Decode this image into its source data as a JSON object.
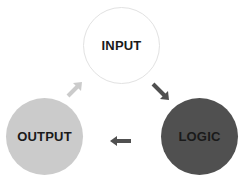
{
  "diagram": {
    "type": "cycle",
    "nodes": [
      {
        "id": "input",
        "label": "INPUT",
        "fill": "#ffffff"
      },
      {
        "id": "logic",
        "label": "LOGIC",
        "fill": "#505050"
      },
      {
        "id": "output",
        "label": "OUTPUT",
        "fill": "#cbcbcb"
      }
    ],
    "edges": [
      {
        "from": "input",
        "to": "logic",
        "color": "#505050"
      },
      {
        "from": "logic",
        "to": "output",
        "color": "#505050"
      },
      {
        "from": "output",
        "to": "input",
        "color": "#cbcbcb"
      }
    ]
  }
}
